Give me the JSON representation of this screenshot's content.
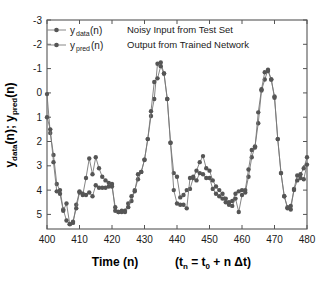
{
  "chart_data": {
    "type": "line",
    "title": "",
    "xlabel": "Time  (n)",
    "xlabel_extra": "(t_n = t_0 + n Δt)",
    "ylabel": "y_data(n); y_pred(n)",
    "xlim": [
      400,
      480
    ],
    "ylim": [
      -3.6,
      5
    ],
    "xticks": [
      400,
      410,
      420,
      430,
      440,
      450,
      460,
      470,
      480
    ],
    "yticks": [
      -3,
      -2,
      -1,
      0,
      1,
      2,
      3,
      4,
      5
    ],
    "grid": false,
    "legend_position": "top-left",
    "marker": "filled-circle",
    "series_color": "#555555",
    "line_color": "#777777",
    "x": [
      400,
      401,
      402,
      403,
      404,
      405,
      406,
      407,
      408,
      409,
      410,
      411,
      412,
      413,
      414,
      415,
      416,
      417,
      418,
      419,
      420,
      421,
      422,
      423,
      424,
      425,
      426,
      427,
      428,
      429,
      430,
      431,
      432,
      433,
      434,
      435,
      436,
      437,
      438,
      439,
      440,
      441,
      442,
      443,
      444,
      445,
      446,
      447,
      448,
      449,
      450,
      451,
      452,
      453,
      454,
      455,
      456,
      457,
      458,
      459,
      460,
      461,
      462,
      463,
      464,
      465,
      466,
      467,
      468,
      469,
      470,
      471,
      472,
      473,
      474,
      475,
      476,
      477,
      478,
      479,
      480
    ],
    "series": [
      {
        "name": "y_data(n)",
        "description": "Noisy Input from Test Set",
        "values": [
          1.95,
          0.35,
          -0.55,
          -1.75,
          -2.0,
          -2.8,
          -3.25,
          -3.4,
          -3.35,
          -2.6,
          -2.05,
          -2.2,
          -1.5,
          -0.7,
          -1.35,
          -0.65,
          -1.1,
          -1.45,
          -1.6,
          -1.7,
          -1.75,
          -2.85,
          -2.9,
          -2.9,
          -2.85,
          -2.55,
          -2.45,
          -2.0,
          -1.55,
          -1.25,
          -0.75,
          0.1,
          1.05,
          1.75,
          3.2,
          3.25,
          2.8,
          1.75,
          -0.05,
          -1.3,
          -1.45,
          -2.3,
          -2.2,
          -2.0,
          -1.95,
          -1.5,
          -1.2,
          -0.85,
          -0.6,
          -1.1,
          -1.2,
          -1.6,
          -1.85,
          -2.0,
          -2.15,
          -2.35,
          -2.6,
          -2.45,
          -2.15,
          -2.05,
          -2.0,
          -2.1,
          -1.45,
          -0.65,
          -0.2,
          0.75,
          2.1,
          2.55,
          2.95,
          2.55,
          1.85,
          0.1,
          -1.3,
          -2.25,
          -2.7,
          -2.8,
          -1.95,
          -1.4,
          -1.35,
          -1.1,
          -0.65
        ]
      },
      {
        "name": "y_pred(n)",
        "description": "Output from Trained Network",
        "values": [
          1.0,
          0.5,
          -0.85,
          -2.05,
          -2.15,
          -2.85,
          -2.55,
          -3.4,
          -3.3,
          -2.75,
          -2.1,
          -2.15,
          -2.2,
          -2.1,
          -2.25,
          -1.8,
          -1.9,
          -1.9,
          -1.9,
          -1.85,
          -1.85,
          -2.7,
          -2.9,
          -2.85,
          -2.9,
          -2.7,
          -2.25,
          -2.05,
          -1.35,
          -1.25,
          -0.75,
          0.1,
          1.25,
          2.45,
          2.6,
          3.1,
          2.8,
          1.75,
          -0.05,
          -2.0,
          -2.55,
          -2.6,
          -2.6,
          -2.75,
          -1.5,
          -1.45,
          -1.6,
          -1.3,
          -1.35,
          -1.5,
          -1.5,
          -1.95,
          -2.15,
          -2.25,
          -2.35,
          -2.5,
          -2.5,
          -2.65,
          -2.35,
          -2.9,
          -2.2,
          -2.0,
          -1.15,
          -0.35,
          -0.25,
          1.2,
          2.15,
          2.85,
          2.9,
          2.55,
          1.8,
          0.1,
          -1.3,
          -2.25,
          -2.75,
          -2.65,
          -2.0,
          -1.6,
          -1.5,
          -1.55,
          -0.95
        ]
      }
    ],
    "legend": [
      {
        "label": "y",
        "sub": "data",
        "suffix": "(n)",
        "note": "Noisy Input from Test Set"
      },
      {
        "label": "y",
        "sub": "pred",
        "suffix": "(n)",
        "note": "Output from Trained Network"
      }
    ]
  },
  "axes": {
    "y_title_main": "y",
    "y_title_sub1": "data",
    "y_title_mid": "(n);  y",
    "y_title_sub2": "pred",
    "y_title_end": "(n)",
    "x_title": "Time  (n)",
    "x_title_paren_open": "(t",
    "x_title_sub_n": "n",
    "x_title_eq": " = t",
    "x_title_sub_0": "0",
    "x_title_rest": " + n Δt)"
  },
  "ticks": {
    "x": [
      "400",
      "410",
      "420",
      "430",
      "440",
      "450",
      "460",
      "470",
      "480"
    ],
    "y": [
      "5",
      "4",
      "3",
      "2",
      "1",
      "0",
      "-1",
      "-2",
      "-3"
    ]
  },
  "colors": {
    "frame": "#555555",
    "marker": "#555555",
    "line": "#888888",
    "text": "#1a1a1a",
    "background": "#ffffff"
  }
}
